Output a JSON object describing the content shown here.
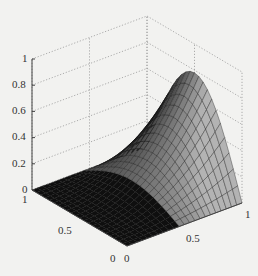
{
  "chart_data": {
    "type": "surface3d",
    "title": "",
    "xlabel": "",
    "ylabel": "",
    "zlabel": "",
    "x_range": [
      0,
      1
    ],
    "y_range": [
      0,
      1
    ],
    "zlim": [
      0,
      1
    ],
    "z_ticks": [
      "0",
      "0.2",
      "0.4",
      "0.6",
      "0.8",
      "1"
    ],
    "x_ticks": [
      "0",
      "0.5",
      "1"
    ],
    "y_ticks": [
      "0",
      "0.5",
      "1"
    ],
    "grid": true,
    "colormap": "gray",
    "peak": {
      "x": 1.0,
      "y": 0.5,
      "z": 0.75
    }
  },
  "labels": {
    "z0": "0",
    "z02": "0.2",
    "z04": "0.4",
    "z06": "0.6",
    "z08": "0.8",
    "z1": "1",
    "left1": "1",
    "left05": "0.5",
    "left0": "0",
    "right0": "0",
    "right05": "0.5",
    "right1": "1"
  }
}
